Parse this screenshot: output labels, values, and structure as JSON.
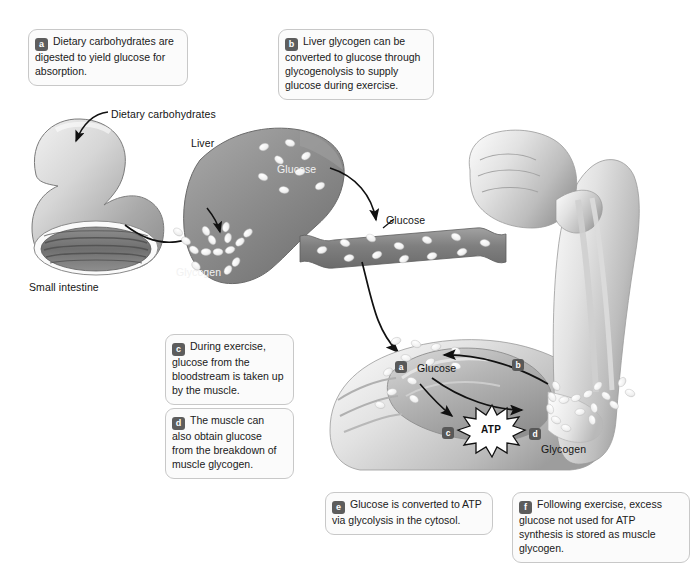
{
  "figure": {
    "background_color": "#ffffff",
    "ink_color": "#1a1a1a",
    "badge_color": "#5d5d5d",
    "box_fill": "#fbfbfb",
    "box_border": "#c8c8c8"
  },
  "callouts": [
    {
      "id": "a",
      "badge": "a",
      "text": "Dietary carbohydrates are digested to yield glucose for absorption.",
      "x": 28,
      "y": 29,
      "w": 160,
      "h": 52
    },
    {
      "id": "b",
      "badge": "b",
      "text": "Liver glycogen can be converted to glucose through glycogenolysis to supply glucose during exercise.",
      "x": 278,
      "y": 29,
      "w": 156,
      "h": 66
    },
    {
      "id": "c",
      "badge": "c",
      "text": "During exercise, glucose from the bloodstream is taken up by the muscle.",
      "x": 165,
      "y": 334,
      "w": 129,
      "h": 62
    },
    {
      "id": "d",
      "badge": "d",
      "text": "The muscle can also obtain glucose from the breakdown of muscle glycogen.",
      "x": 165,
      "y": 408,
      "w": 129,
      "h": 62
    },
    {
      "id": "e",
      "badge": "e",
      "text": "Glucose is converted to ATP via glycolysis in the cytosol.",
      "x": 325,
      "y": 492,
      "w": 168,
      "h": 42
    },
    {
      "id": "f",
      "badge": "f",
      "text": "Following exercise, excess glucose not used for ATP synthesis is stored as muscle glycogen.",
      "x": 512,
      "y": 492,
      "w": 178,
      "h": 52
    }
  ],
  "figure_labels": [
    {
      "name": "dietary-carbohydrates",
      "text": "Dietary carbohydrates",
      "x": 111,
      "y": 108,
      "tone": "dark"
    },
    {
      "name": "small-intestine",
      "text": "Small intestine",
      "x": 29,
      "y": 281,
      "tone": "dark"
    },
    {
      "name": "liver",
      "text": "Liver",
      "x": 191,
      "y": 137,
      "tone": "dark"
    },
    {
      "name": "liver-glucose",
      "text": "Glucose",
      "x": 277,
      "y": 163,
      "tone": "light"
    },
    {
      "name": "liver-glycogen",
      "text": "Glycogen",
      "x": 176,
      "y": 266,
      "tone": "light"
    },
    {
      "name": "blood-glucose",
      "text": "Glucose",
      "x": 386,
      "y": 214,
      "tone": "dark"
    },
    {
      "name": "muscle-glucose",
      "text": "Glucose",
      "x": 417,
      "y": 362,
      "tone": "dark"
    },
    {
      "name": "muscle-glycogen",
      "text": "Glycogen",
      "x": 541,
      "y": 443,
      "tone": "dark"
    },
    {
      "name": "atp",
      "text": "ATP",
      "x": 481,
      "y": 424,
      "tone": "dark"
    }
  ],
  "art_markers": [
    {
      "name": "marker-a",
      "letter": "a",
      "x": 395,
      "y": 361
    },
    {
      "name": "marker-b",
      "letter": "b",
      "x": 512,
      "y": 359
    },
    {
      "name": "marker-c",
      "letter": "c",
      "x": 442,
      "y": 427
    },
    {
      "name": "marker-d",
      "letter": "d",
      "x": 529,
      "y": 428
    }
  ],
  "art_parts": [
    {
      "name": "small-intestine-illustration",
      "description": "Cut-away loop of small intestine, shaded gray, open lumen showing folds"
    },
    {
      "name": "liver-illustration",
      "description": "Gray liver lobe dotted with white glucose ovals and a branched glycogen cluster"
    },
    {
      "name": "blood-vessel-illustration",
      "description": "Gray ribbon-shaped blood vessel carrying white glucose ovals"
    },
    {
      "name": "arm-illustration",
      "description": "Flexed arm with fist, forearm bones and biceps muscle"
    },
    {
      "name": "atp-starburst",
      "description": "White spiky starburst containing the label ATP"
    },
    {
      "name": "muscle-glycogen-cluster",
      "description": "Branched chain of white glycogen beads inside the muscle"
    }
  ],
  "arrows": [
    {
      "name": "arrow-dietary-carbs-to-intestine",
      "description": "Curved leader arrow from the Dietary carbohydrates label down-left to the intestine wall"
    },
    {
      "name": "arrow-intestine-to-liver",
      "description": "Long curved arrow from the intestine across to the liver"
    },
    {
      "name": "arrow-liver-to-glycogen",
      "description": "Short curved arrow inside liver pointing to the glycogen cluster"
    },
    {
      "name": "arrow-liver-glucose-to-vessel",
      "description": "Curved arrow from liver glucose down into the blood vessel"
    },
    {
      "name": "arrow-vessel-to-muscle",
      "description": "Long curved arrow from the blood vessel down into the muscle"
    },
    {
      "name": "arrow-glucose-to-atp",
      "description": "Short curved arrow from muscle glucose to the ATP starburst"
    },
    {
      "name": "arrow-glycogen-to-glucose",
      "description": "Arrow from muscle glycogen leftwards to muscle glucose"
    },
    {
      "name": "arrow-glucose-to-glycogen",
      "description": "Arrow from muscle glucose rightwards to muscle glycogen"
    }
  ]
}
